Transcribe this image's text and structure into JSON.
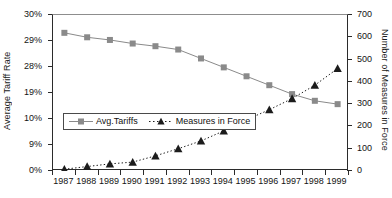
{
  "chart_data": {
    "type": "line",
    "title": "",
    "xlabel": "",
    "categories": [
      "1987",
      "1988",
      "1989",
      "1990",
      "1991",
      "1992",
      "1993",
      "1994",
      "1995",
      "1996",
      "1997",
      "1998",
      "1999"
    ],
    "grid": false,
    "legend_position": "inside-lower-left",
    "axes": {
      "left": {
        "label": "Average Tariff Rate",
        "tick_labels": [
          "30%",
          "29%",
          "28%",
          "19%",
          "10%",
          "9%",
          "0%"
        ],
        "tick_count": 7
      },
      "right": {
        "label": "Number of Measures in Force",
        "tick_labels": [
          "700",
          "600",
          "500",
          "400",
          "300",
          "200",
          "100",
          "0"
        ],
        "ylim": [
          0,
          700
        ],
        "tick_count": 8
      }
    },
    "series": [
      {
        "name": "Avg.Tariffs",
        "axis": "left",
        "marker": "square",
        "line_style": "solid",
        "color": "#8a8a8a",
        "values": [
          29.5,
          29.0,
          28.6,
          28.2,
          27.9,
          27.5,
          26.6,
          25.6,
          24.6,
          23.5,
          22.5,
          21.8,
          21.5
        ],
        "values_right_scale": [
          620,
          600,
          588,
          572,
          560,
          545,
          505,
          465,
          425,
          385,
          345,
          315,
          300
        ]
      },
      {
        "name": "Measures in Force",
        "axis": "right",
        "marker": "triangle",
        "line_style": "dotted",
        "color": "#1c1c1c",
        "values": [
          8,
          20,
          32,
          40,
          68,
          100,
          135,
          180,
          230,
          275,
          325,
          385,
          460
        ]
      }
    ]
  },
  "legend": {
    "items": [
      {
        "label": "Avg.Tariffs",
        "marker": "square-marker",
        "color": "#8a8a8a"
      },
      {
        "label": "Measures in Force",
        "marker": "triangle-marker",
        "color": "#1c1c1c"
      }
    ]
  }
}
